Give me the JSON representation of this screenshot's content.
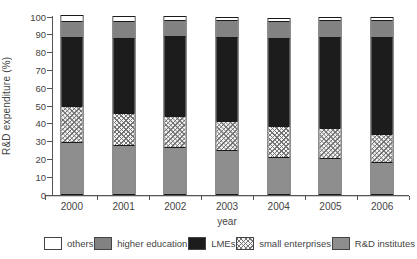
{
  "chart_data": {
    "type": "bar",
    "stacked": true,
    "xlabel": "year",
    "ylabel": "R&D expenditure (%)",
    "ylim": [
      0,
      100
    ],
    "yticks": [
      0,
      10,
      20,
      30,
      40,
      50,
      60,
      70,
      80,
      90,
      100
    ],
    "grid": false,
    "categories": [
      "2000",
      "2001",
      "2002",
      "2003",
      "2004",
      "2005",
      "2006"
    ],
    "series": [
      {
        "name": "R&D institutes",
        "style": "gray-light",
        "color": "#8e8e8e",
        "values": [
          29,
          27.5,
          26.5,
          24.5,
          21,
          20,
          18
        ]
      },
      {
        "name": "small enterprises",
        "style": "crosshatch",
        "color": "#f3f3f3",
        "pattern_color": "#6e6e6e",
        "values": [
          20.5,
          18,
          17.5,
          16.5,
          17,
          17,
          16
        ]
      },
      {
        "name": "LMEs",
        "style": "solid-black",
        "color": "#1c1c1c",
        "values": [
          39,
          42,
          44.5,
          47,
          49.5,
          51,
          54.5
        ]
      },
      {
        "name": "higher education",
        "style": "gray",
        "color": "#828282",
        "values": [
          8.5,
          9.5,
          9,
          9.5,
          9.5,
          10,
          9.5
        ]
      },
      {
        "name": "others",
        "style": "white",
        "color": "#ffffff",
        "values": [
          3,
          2.5,
          2,
          1.5,
          1.5,
          1,
          1
        ]
      }
    ],
    "legend": {
      "position": "bottom",
      "order": [
        "others",
        "higher education",
        "LMEs",
        "small enterprises",
        "R&D institutes"
      ]
    }
  }
}
